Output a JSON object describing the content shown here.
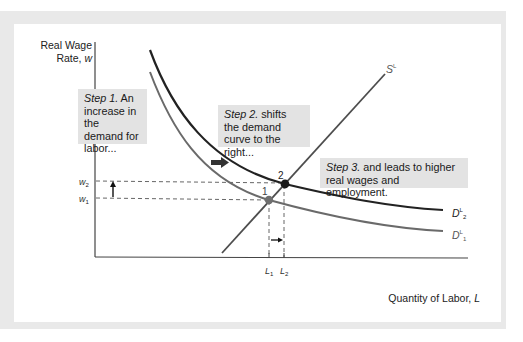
{
  "diagram": {
    "type": "labor-market-supply-demand",
    "y_axis": {
      "label_line1": "Real Wage",
      "label_line2": "Rate, ",
      "label_var": "w"
    },
    "x_axis": {
      "label": "Quantity of Labor, ",
      "label_var": "L"
    },
    "curves": [
      {
        "id": "SL",
        "name": "S",
        "sup": "L",
        "color": "#4d4d4d"
      },
      {
        "id": "DL2",
        "name": "D",
        "sup": "L",
        "sub": "2",
        "color": "#222222"
      },
      {
        "id": "DL1",
        "name": "D",
        "sup": "L",
        "sub": "1",
        "color": "#6a6a6a"
      }
    ],
    "points": [
      {
        "label": "1",
        "color": "#6f6f6f"
      },
      {
        "label": "2",
        "color": "#1a1a1a"
      }
    ],
    "wage_ticks": [
      {
        "name": "w",
        "sub": "2"
      },
      {
        "name": "w",
        "sub": "1"
      }
    ],
    "quantity_ticks": [
      {
        "name": "L",
        "sub": "1"
      },
      {
        "name": "L",
        "sub": "2"
      }
    ],
    "steps": [
      {
        "lead": "Step 1.",
        "text": " An increase in the demand for labor..."
      },
      {
        "lead": "Step 2.",
        "text": " shifts the demand curve to the right..."
      },
      {
        "lead": "Step 3.",
        "text": " and leads to higher real wages and employment."
      }
    ]
  },
  "colors": {
    "frame": "#e9e9e9",
    "note_bg": "#e3e3e3",
    "axis": "#333333"
  }
}
